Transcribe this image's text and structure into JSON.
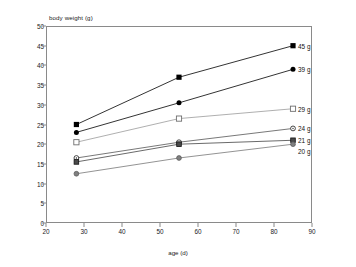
{
  "chart_data": {
    "type": "line",
    "title": "",
    "xlabel": "age (d)",
    "ylabel": "body weight (g)",
    "xlim": [
      20,
      90
    ],
    "ylim": [
      0,
      50
    ],
    "xticks": [
      20,
      30,
      40,
      50,
      60,
      70,
      80,
      90
    ],
    "yticks": [
      0,
      5,
      10,
      15,
      20,
      25,
      30,
      35,
      40,
      45,
      50
    ],
    "grid": false,
    "legend": "end-of-line labels",
    "x": [
      28,
      55,
      85
    ],
    "series": [
      {
        "name": "45 g",
        "label": "45 g",
        "marker": "filled-square",
        "color": "#000000",
        "values": [
          25.0,
          37.0,
          45.0
        ]
      },
      {
        "name": "39 g",
        "label": "39 g",
        "marker": "filled-circle",
        "color": "#000000",
        "values": [
          23.0,
          30.5,
          39.0
        ]
      },
      {
        "name": "29 g",
        "label": "29 g",
        "marker": "open-square",
        "color": "#9a9a9a",
        "values": [
          20.5,
          26.5,
          29.0
        ]
      },
      {
        "name": "24 g",
        "label": "24 g",
        "marker": "open-circle",
        "color": "#555555",
        "values": [
          16.5,
          20.5,
          24.0
        ]
      },
      {
        "name": "21 g",
        "label": "21 g",
        "marker": "filled-square-small",
        "color": "#444444",
        "values": [
          15.5,
          20.0,
          21.0
        ]
      },
      {
        "name": "20 g",
        "label": "20 g",
        "marker": "gray-filled-circle",
        "color": "#777777",
        "values": [
          12.5,
          16.5,
          20.0
        ]
      }
    ]
  },
  "axes": {
    "y_title": "body weight (g)",
    "x_title": "age (d)",
    "y_tick_labels": [
      "0",
      "5",
      "10",
      "15",
      "20",
      "25",
      "30",
      "35",
      "40",
      "45",
      "50"
    ],
    "x_tick_labels": [
      "20",
      "30",
      "40",
      "50",
      "60",
      "70",
      "80",
      "90"
    ]
  },
  "colors": {
    "axis": "#8a8a8a",
    "text": "#1a1a1a",
    "dark_series": "#000000",
    "light_series": "#9a9a9a"
  }
}
